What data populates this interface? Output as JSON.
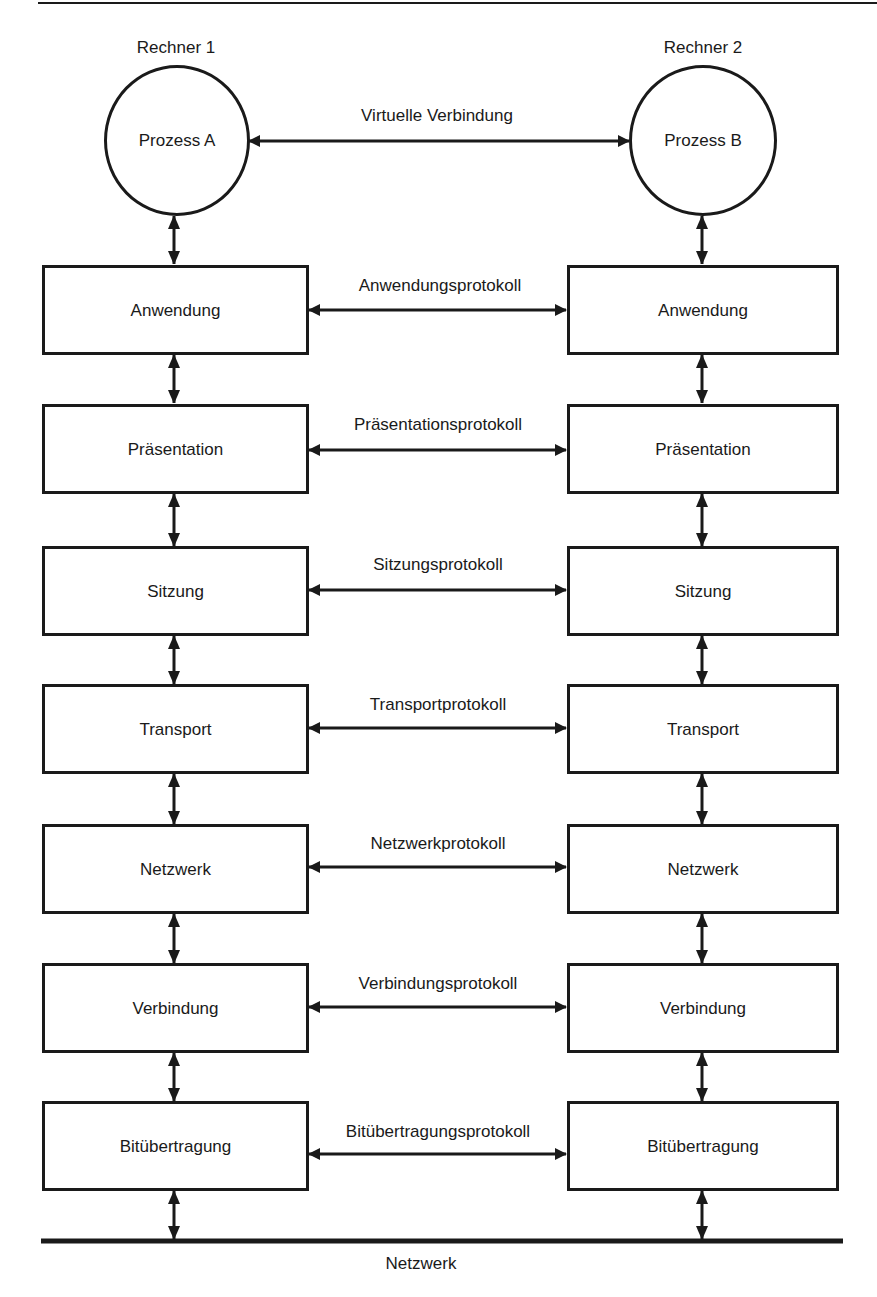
{
  "computers": [
    {
      "label": "Rechner 1",
      "process": "Prozess A"
    },
    {
      "label": "Rechner 2",
      "process": "Prozess B"
    }
  ],
  "virtual_connection": "Virtuelle Verbindung",
  "layers": [
    {
      "name": "Anwendung",
      "protocol": "Anwendungsprotokoll"
    },
    {
      "name": "Präsentation",
      "protocol": "Präsentationsprotokoll"
    },
    {
      "name": "Sitzung",
      "protocol": "Sitzungsprotokoll"
    },
    {
      "name": "Transport",
      "protocol": "Transportprotokoll"
    },
    {
      "name": "Netzwerk",
      "protocol": "Netzwerkprotokoll"
    },
    {
      "name": "Verbindung",
      "protocol": "Verbindungsprotokoll"
    },
    {
      "name": "Bitübertragung",
      "protocol": "Bitübertragungsprotokoll"
    }
  ],
  "network_label": "Netzwerk",
  "colors": {
    "stroke": "#1a1a1a",
    "background": "#ffffff"
  }
}
